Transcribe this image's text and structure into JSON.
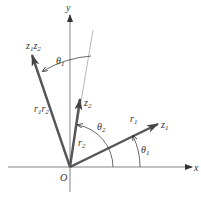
{
  "figure": {
    "colors": {
      "axis": "#555555",
      "vector": "#555555",
      "thin": "#888888",
      "background": "#ffffff"
    },
    "axes": {
      "x_label": "x",
      "y_label": "y",
      "origin_label": "O"
    },
    "vectors": [
      {
        "id": "z1",
        "label": "z",
        "label_sub": "1",
        "modulus_label": "r",
        "modulus_sub": "1"
      },
      {
        "id": "z2",
        "label": "z",
        "label_sub": "2",
        "modulus_label": "r",
        "modulus_sub": "2"
      },
      {
        "id": "z1z2",
        "label": "z",
        "label_sub": "1",
        "label2": "z",
        "label2_sub": "2",
        "modulus_label": "r",
        "modulus_sub": "1",
        "modulus2_label": "r",
        "modulus2_sub": "2"
      }
    ],
    "angles": [
      {
        "id": "theta1_lower",
        "label": "θ",
        "sub": "1"
      },
      {
        "id": "theta2",
        "label": "θ",
        "sub": "2"
      },
      {
        "id": "theta1_upper",
        "label": "θ",
        "sub": "1"
      }
    ]
  }
}
